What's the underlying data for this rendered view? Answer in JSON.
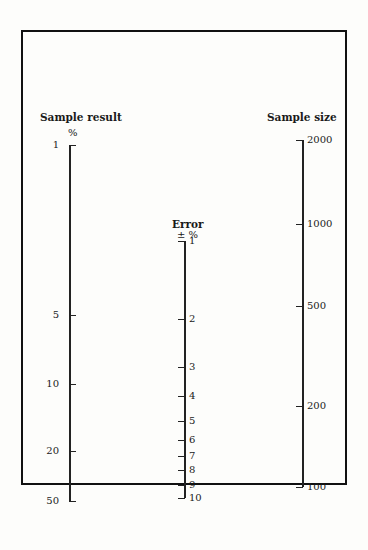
{
  "chart_data": {
    "type": "nomogram",
    "title": "",
    "axes": [
      {
        "name": "Sample result",
        "unit": "%",
        "scale": "log",
        "ticks": [
          "1",
          "5",
          "10",
          "20",
          "50"
        ]
      },
      {
        "name": "Error",
        "unit": "± %",
        "scale": "log",
        "ticks": [
          "1",
          "2",
          "3",
          "4",
          "5",
          "6",
          "7",
          "8",
          "9",
          "10"
        ]
      },
      {
        "name": "Sample size",
        "unit": "",
        "scale": "log",
        "ticks": [
          "2000",
          "1000",
          "500",
          "200",
          "100"
        ]
      }
    ]
  },
  "left": {
    "title": "Sample result",
    "unit": "%",
    "ticks": [
      {
        "label": "1",
        "y": 145
      },
      {
        "label": "5",
        "y": 315
      },
      {
        "label": "10",
        "y": 384
      },
      {
        "label": "20",
        "y": 451
      },
      {
        "label": "50",
        "y": 501
      }
    ]
  },
  "middle": {
    "title": "Error",
    "unit": "± %",
    "ticks": [
      {
        "label": "1",
        "y": 241
      },
      {
        "label": "2",
        "y": 319
      },
      {
        "label": "3",
        "y": 367
      },
      {
        "label": "4",
        "y": 396
      },
      {
        "label": "5",
        "y": 421
      },
      {
        "label": "6",
        "y": 440
      },
      {
        "label": "7",
        "y": 456
      },
      {
        "label": "8",
        "y": 470
      },
      {
        "label": "9",
        "y": 485
      },
      {
        "label": "10",
        "y": 498
      }
    ]
  },
  "right": {
    "title": "Sample size",
    "unit": "",
    "ticks": [
      {
        "label": "2000",
        "y": 140
      },
      {
        "label": "1000",
        "y": 224
      },
      {
        "label": "500",
        "y": 306
      },
      {
        "label": "200",
        "y": 406
      },
      {
        "label": "100",
        "y": 487
      }
    ]
  }
}
